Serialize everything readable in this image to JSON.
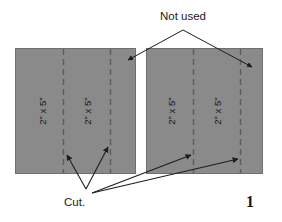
{
  "figure": {
    "page_number": "1",
    "annotations": {
      "not_used_label": "Not used",
      "cut_label": "Cut."
    },
    "colors": {
      "panel_fill": "#8a8a8a",
      "panel_stroke": "#6f6f6f",
      "cut_line": "#5d5d5d",
      "leader_line": "#1d1d1d",
      "text": "#1a1a1a",
      "background": "#ffffff"
    },
    "boards": [
      {
        "name": "left-board",
        "pieces": [
          {
            "label": "2\" x 5\""
          },
          {
            "label": "2\" x 5\""
          }
        ]
      },
      {
        "name": "right-board",
        "pieces": [
          {
            "label": "2\" x 5\""
          },
          {
            "label": "2\" x 5\""
          }
        ]
      }
    ]
  }
}
